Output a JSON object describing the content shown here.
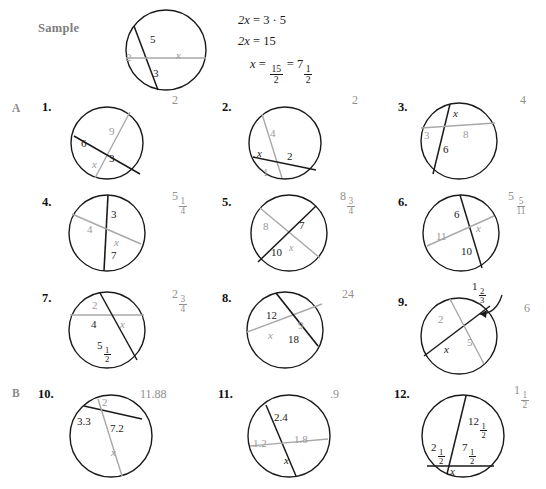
{
  "worksheet": {
    "sample_label": "Sample",
    "sections": {
      "a": "A",
      "b": "B"
    },
    "sample_equations": {
      "line1_lhs": "2x",
      "line1_rhs": "3 · 5",
      "line2_lhs": "2x",
      "line2_rhs": "15",
      "line3_lhs": "x",
      "line3_frac_num": "15",
      "line3_frac_den": "2",
      "line3_mixed_whole": "7",
      "line3_mixed_num": "1",
      "line3_mixed_den": "2",
      "equals": "="
    },
    "sample_figure": {
      "labels": [
        {
          "text": "5",
          "style": "dark"
        },
        {
          "text": "2",
          "style": "gray"
        },
        {
          "text": "x",
          "style": "gray"
        },
        {
          "text": "3",
          "style": "dark"
        }
      ]
    },
    "problems": [
      {
        "number": "1.",
        "answer": "2",
        "labels": [
          {
            "text": "9",
            "style": "gray"
          },
          {
            "text": "6",
            "style": "dark"
          },
          {
            "text": "x",
            "style": "gray"
          },
          {
            "text": "3",
            "style": "dark"
          }
        ]
      },
      {
        "number": "2.",
        "answer": "2",
        "labels": [
          {
            "text": "4",
            "style": "gray"
          },
          {
            "text": "x",
            "style": "dark"
          },
          {
            "text": "2",
            "style": "dark"
          },
          {
            "text": "1",
            "style": "gray"
          }
        ]
      },
      {
        "number": "3.",
        "answer": "4",
        "labels": [
          {
            "text": "x",
            "style": "dark"
          },
          {
            "text": "3",
            "style": "gray"
          },
          {
            "text": "8",
            "style": "gray"
          },
          {
            "text": "6",
            "style": "dark"
          }
        ]
      },
      {
        "number": "4.",
        "answer_whole": "5",
        "answer_num": "1",
        "answer_den": "4",
        "labels": [
          {
            "text": "3",
            "style": "dark"
          },
          {
            "text": "4",
            "style": "gray"
          },
          {
            "text": "x",
            "style": "gray"
          },
          {
            "text": "7",
            "style": "dark"
          }
        ]
      },
      {
        "number": "5.",
        "answer_whole": "8",
        "answer_num": "3",
        "answer_den": "4",
        "labels": [
          {
            "text": "8",
            "style": "gray"
          },
          {
            "text": "7",
            "style": "dark"
          },
          {
            "text": "10",
            "style": "dark"
          },
          {
            "text": "x",
            "style": "gray"
          }
        ]
      },
      {
        "number": "6.",
        "answer_whole": "5",
        "answer_num": "5",
        "answer_den": "11",
        "labels": [
          {
            "text": "6",
            "style": "dark"
          },
          {
            "text": "x",
            "style": "gray"
          },
          {
            "text": "11",
            "style": "gray"
          },
          {
            "text": "10",
            "style": "dark"
          }
        ]
      },
      {
        "number": "7.",
        "answer_whole": "2",
        "answer_num": "3",
        "answer_den": "4",
        "labels": [
          {
            "text": "2",
            "style": "gray"
          },
          {
            "text": "4",
            "style": "dark"
          },
          {
            "text": "x",
            "style": "gray"
          },
          {
            "text": "5",
            "style": "dark",
            "frac_num": "1",
            "frac_den": "2"
          }
        ]
      },
      {
        "number": "8.",
        "answer": "24",
        "labels": [
          {
            "text": "12",
            "style": "dark"
          },
          {
            "text": "9",
            "style": "gray"
          },
          {
            "text": "x",
            "style": "gray"
          },
          {
            "text": "18",
            "style": "dark"
          }
        ]
      },
      {
        "number": "9.",
        "answer": "6",
        "callout_whole": "1",
        "callout_num": "2",
        "callout_den": "3",
        "labels": [
          {
            "text": "2",
            "style": "gray"
          },
          {
            "text": "x",
            "style": "dark"
          },
          {
            "text": "5",
            "style": "gray"
          }
        ]
      },
      {
        "number": "10.",
        "answer": "11.88",
        "labels": [
          {
            "text": "2",
            "style": "gray"
          },
          {
            "text": "3.3",
            "style": "dark"
          },
          {
            "text": "7.2",
            "style": "dark"
          },
          {
            "text": "x",
            "style": "gray"
          }
        ]
      },
      {
        "number": "11.",
        "answer": ".9",
        "labels": [
          {
            "text": "2.4",
            "style": "dark"
          },
          {
            "text": "1.2",
            "style": "gray"
          },
          {
            "text": "1.8",
            "style": "gray"
          },
          {
            "text": "x",
            "style": "dark"
          }
        ]
      },
      {
        "number": "12.",
        "answer_whole": "1",
        "answer_num": "1",
        "answer_den": "2",
        "labels": [
          {
            "text": "12",
            "style": "dark",
            "frac_num": "1",
            "frac_den": "2"
          },
          {
            "text": "2",
            "style": "dark",
            "frac_num": "1",
            "frac_den": "2"
          },
          {
            "text": "7",
            "style": "dark",
            "frac_num": "1",
            "frac_den": "2"
          },
          {
            "text": "x",
            "style": "dark"
          }
        ]
      }
    ]
  },
  "colors": {
    "dark_stroke": "#1a1a1a",
    "gray_stroke": "#a8a8a8",
    "answer_text": "#8f8f8f",
    "gray_label": "#9a9a9a"
  }
}
